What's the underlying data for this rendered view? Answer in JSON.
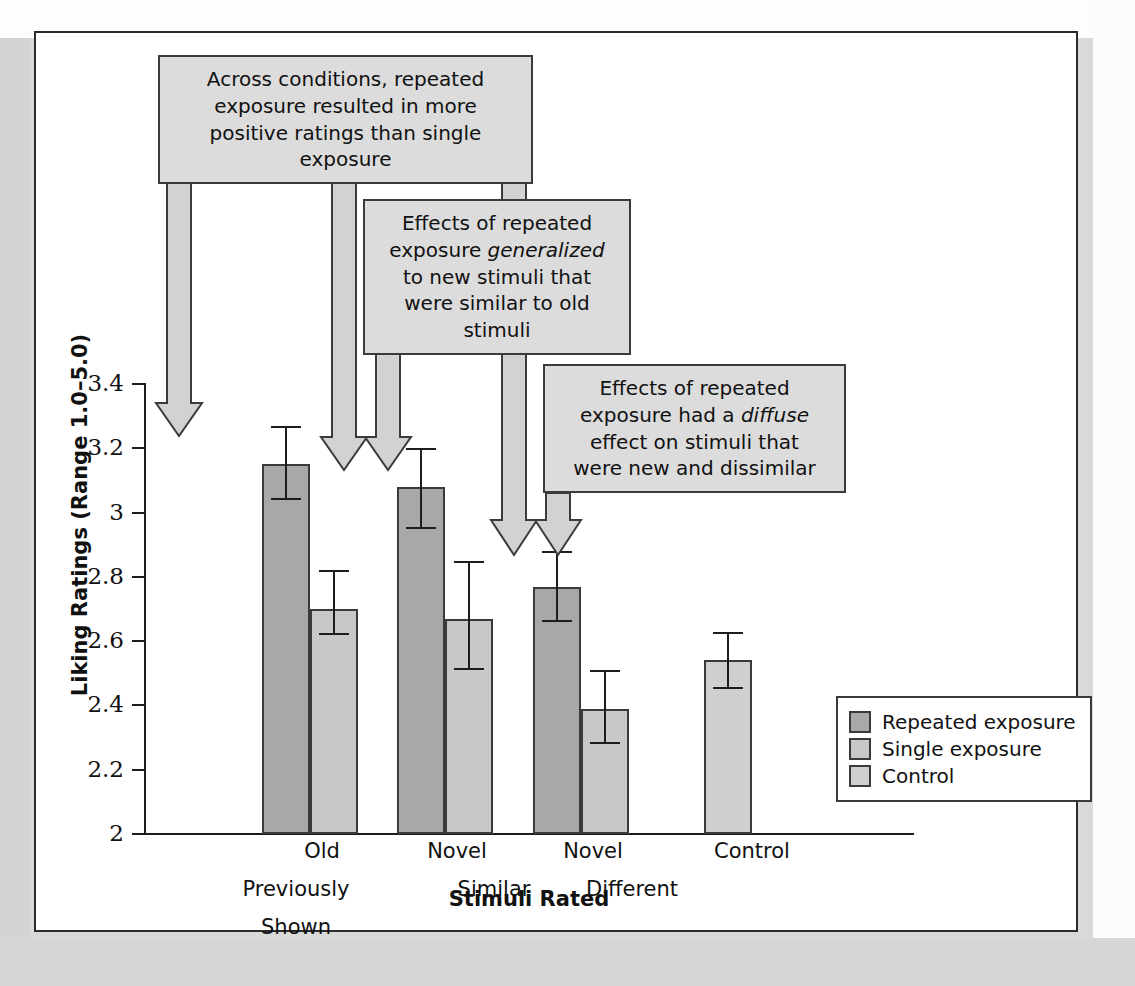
{
  "chart_data": {
    "type": "bar",
    "title": "",
    "xlabel": "Stimuli Rated",
    "ylabel": "Liking Ratings (Range 1.0–5.0)",
    "ylim": [
      2,
      3.4
    ],
    "ytick_labels": [
      "3.4",
      "3.2",
      "3",
      "2.8",
      "2.6",
      "2.4",
      "2.2",
      "2"
    ],
    "ytick_values": [
      3.4,
      3.2,
      3.0,
      2.8,
      2.6,
      2.4,
      2.2,
      2.0
    ],
    "grid": false,
    "legend_position": "bottom-right",
    "categories": [
      "Old Previously Shown",
      "Novel Similar",
      "Novel Different",
      "Control"
    ],
    "category_labels": [
      {
        "line1": "Old",
        "line2": "Previously",
        "line3": "Shown"
      },
      {
        "line1": "Novel",
        "line2": "Similar",
        "line3": ""
      },
      {
        "line1": "Novel",
        "line2": "Different",
        "line3": ""
      },
      {
        "line1": "Control",
        "line2": "",
        "line3": ""
      }
    ],
    "series": [
      {
        "name": "Repeated exposure",
        "color": "#a8a8a8",
        "values": [
          3.15,
          3.08,
          2.77,
          null
        ],
        "errors": [
          0.115,
          0.125,
          0.105,
          null
        ]
      },
      {
        "name": "Single exposure",
        "color": "#c8c8c8",
        "values": [
          2.7,
          2.67,
          2.39,
          null
        ],
        "errors": [
          0.09,
          0.165,
          0.11,
          null
        ]
      },
      {
        "name": "Control",
        "color": "#cfcfcf",
        "values": [
          null,
          null,
          null,
          2.54
        ],
        "errors": [
          null,
          null,
          null,
          0.09
        ]
      }
    ],
    "bars": [
      {
        "group": "Old Previously Shown",
        "series": "Repeated exposure",
        "value": 3.15,
        "err_low": 3.04,
        "err_high": 3.27
      },
      {
        "group": "Old Previously Shown",
        "series": "Single exposure",
        "value": 2.7,
        "err_low": 2.62,
        "err_high": 2.82
      },
      {
        "group": "Novel Similar",
        "series": "Repeated exposure",
        "value": 3.08,
        "err_low": 2.95,
        "err_high": 3.2
      },
      {
        "group": "Novel Similar",
        "series": "Single exposure",
        "value": 2.67,
        "err_low": 2.51,
        "err_high": 2.85
      },
      {
        "group": "Novel Different",
        "series": "Repeated exposure",
        "value": 2.77,
        "err_low": 2.66,
        "err_high": 2.88
      },
      {
        "group": "Novel Different",
        "series": "Single exposure",
        "value": 2.39,
        "err_low": 2.28,
        "err_high": 2.51
      },
      {
        "group": "Control",
        "series": "Control",
        "value": 2.54,
        "err_low": 2.45,
        "err_high": 2.63
      }
    ],
    "annotations": [
      {
        "id": "annotation-1",
        "text_plain": "Across conditions, repeated exposure resulted in more positive ratings than single exposure",
        "lines": [
          "Across conditions, repeated",
          "exposure resulted in more",
          "positive ratings than single",
          "exposure"
        ],
        "points_to": [
          "Old Previously Shown / Repeated exposure",
          "Novel Similar / Repeated exposure",
          "Novel Different / Repeated exposure"
        ]
      },
      {
        "id": "annotation-2",
        "text_plain": "Effects of repeated exposure generalized to new stimuli that were similar to old stimuli",
        "lines": [
          "Effects of repeated",
          "exposure generalized",
          "to new stimuli that",
          "were similar to old",
          "stimuli"
        ],
        "italic_word": "generalized",
        "points_to": [
          "Novel Similar / Repeated exposure"
        ]
      },
      {
        "id": "annotation-3",
        "text_plain": "Effects of repeated exposure had a diffuse effect on stimuli that were new and dissimilar",
        "lines": [
          "Effects of repeated",
          "exposure had a diffuse",
          "effect on stimuli that",
          "were new and dissimilar"
        ],
        "italic_word": "diffuse",
        "points_to": [
          "Novel Different / Repeated exposure"
        ]
      }
    ],
    "legend": [
      {
        "label": "Repeated exposure",
        "color": "#a8a8a8"
      },
      {
        "label": "Single exposure",
        "color": "#c8c8c8"
      },
      {
        "label": "Control",
        "color": "#cfcfcf"
      }
    ]
  }
}
